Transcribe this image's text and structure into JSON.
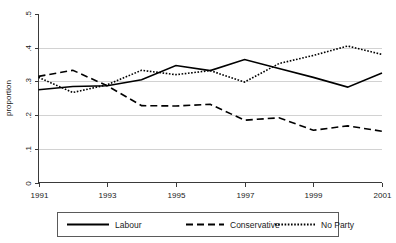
{
  "chart_data": {
    "type": "line",
    "title": "",
    "xlabel": "",
    "ylabel": "proportion",
    "x": [
      1991,
      1992,
      1993,
      1994,
      1995,
      1996,
      1997,
      1998,
      1999,
      2000,
      2001
    ],
    "xlim": [
      1991,
      2001
    ],
    "ylim": [
      0,
      0.5
    ],
    "xticks": [
      1991,
      1993,
      1995,
      1997,
      1999,
      2001
    ],
    "xtick_labels": [
      "1991",
      "1993",
      "1995",
      "1997",
      "1999",
      "2001"
    ],
    "yticks": [
      0,
      0.1,
      0.2,
      0.3,
      0.4,
      0.5
    ],
    "ytick_labels": [
      "0",
      ".1",
      ".2",
      ".3",
      ".4",
      ".5"
    ],
    "grid": "horizontal gridlines at .1 .2 .3 .4",
    "legend_position": "below-plot",
    "series": [
      {
        "name": "Labour",
        "style": "solid",
        "values": [
          0.275,
          0.285,
          0.287,
          0.305,
          0.347,
          0.332,
          0.365,
          0.338,
          0.312,
          0.283,
          0.325
        ]
      },
      {
        "name": "Conservative",
        "style": "dashed",
        "values": [
          0.315,
          0.333,
          0.287,
          0.228,
          0.227,
          0.232,
          0.185,
          0.192,
          0.155,
          0.168,
          0.152
        ]
      },
      {
        "name": "No Party",
        "style": "dotted",
        "values": [
          0.312,
          0.267,
          0.29,
          0.333,
          0.32,
          0.332,
          0.298,
          0.353,
          0.377,
          0.405,
          0.38
        ]
      }
    ]
  },
  "legend": {
    "items": [
      {
        "label": "Labour"
      },
      {
        "label": "Conservative"
      },
      {
        "label": "No Party"
      }
    ]
  },
  "colors": {
    "line": "#000000",
    "grid": "#d2d2d2",
    "axis": "#3a3a3a",
    "background": "#ffffff"
  }
}
